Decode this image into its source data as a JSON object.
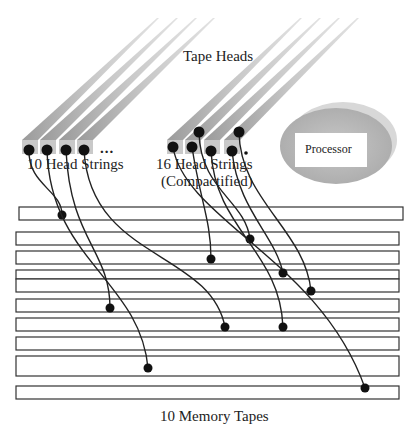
{
  "title_label": "Tape Heads",
  "left_group": {
    "label": "10 Head Strings",
    "ellipsis": "...",
    "beams": [
      {
        "tip": [
          157,
          18
        ],
        "base": [
          22,
          140
        ]
      },
      {
        "tip": [
          176,
          18
        ],
        "base": [
          40,
          140
        ]
      },
      {
        "tip": [
          195,
          18
        ],
        "base": [
          59,
          140
        ]
      },
      {
        "tip": [
          213,
          18
        ],
        "base": [
          77,
          140
        ]
      }
    ],
    "heads": [
      [
        29,
        150
      ],
      [
        47,
        150
      ],
      [
        66,
        150
      ],
      [
        84,
        150
      ]
    ]
  },
  "right_group": {
    "label_line1": "16 Head Strings",
    "label_line2": "(Compactified)",
    "beams": [
      {
        "tip": [
          300,
          18
        ],
        "base": [
          167,
          140
        ]
      },
      {
        "tip": [
          319,
          18
        ],
        "base": [
          185,
          140
        ]
      },
      {
        "tip": [
          338,
          18
        ],
        "base": [
          204,
          140
        ]
      },
      {
        "tip": [
          357,
          18
        ],
        "base": [
          224,
          140
        ]
      }
    ],
    "heads": [
      [
        173,
        147
      ],
      [
        192,
        147
      ],
      [
        199,
        132
      ],
      [
        211,
        151
      ],
      [
        232,
        151
      ],
      [
        239,
        132
      ]
    ],
    "small_dot": [
      246,
      153
    ]
  },
  "processor": {
    "label": "Processor",
    "fill": "#b9b9b9",
    "fill_back": "#d6d6d6"
  },
  "memory": {
    "label": "10 Memory Tapes",
    "tapes": [
      {
        "x": 19,
        "y": 207,
        "w": 384,
        "h": 13
      },
      {
        "x": 16,
        "y": 232,
        "w": 383,
        "h": 13
      },
      {
        "x": 16,
        "y": 251,
        "w": 383,
        "h": 13
      },
      {
        "x": 16,
        "y": 270,
        "w": 383,
        "h": 9
      },
      {
        "x": 16,
        "y": 279,
        "w": 383,
        "h": 13
      },
      {
        "x": 16,
        "y": 299,
        "w": 383,
        "h": 13
      },
      {
        "x": 16,
        "y": 318,
        "w": 383,
        "h": 13
      },
      {
        "x": 16,
        "y": 337,
        "w": 383,
        "h": 13
      },
      {
        "x": 16,
        "y": 356,
        "w": 383,
        "h": 20
      },
      {
        "x": 16,
        "y": 386,
        "w": 383,
        "h": 13
      }
    ]
  },
  "wires": [
    {
      "d": "M29,150 C28,185 62,190 62,215",
      "end": [
        62,
        215
      ]
    },
    {
      "d": "M47,150 C50,260 140,280 148,368",
      "end": [
        148,
        368
      ]
    },
    {
      "d": "M66,150 C70,240 110,250 110,308",
      "end": [
        110,
        308
      ]
    },
    {
      "d": "M84,150 C90,260 210,250 225,327",
      "end": [
        225,
        327
      ]
    },
    {
      "d": "M173,147 C185,220 320,260 365,388",
      "end": [
        365,
        388
      ]
    },
    {
      "d": "M192,147 C200,200 211,220 211,259",
      "end": [
        211,
        259
      ]
    },
    {
      "d": "M199,132 C200,190 245,200 250,239",
      "end": [
        250,
        239
      ]
    },
    {
      "d": "M211,151 C215,230 280,250 283,327",
      "end": [
        283,
        327
      ]
    },
    {
      "d": "M232,151 C238,210 275,235 283,273",
      "end": [
        283,
        273
      ]
    },
    {
      "d": "M239,132 C240,200 305,230 311,291",
      "end": [
        311,
        291
      ]
    }
  ]
}
